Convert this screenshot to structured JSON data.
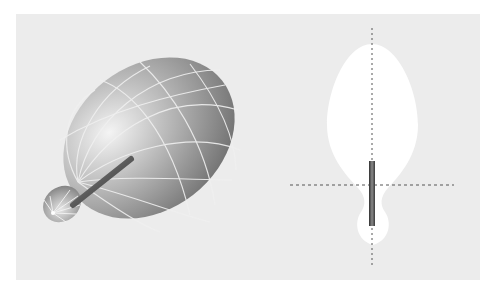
{
  "figure": {
    "background_color": "#ececec",
    "page_color": "#ffffff",
    "left_panel": {
      "type": "3d-radiation-pattern",
      "lobe_color": "#9a9a9a",
      "grid_line_color": "#f2f2f2",
      "antenna_color": "#555555"
    },
    "right_panel": {
      "type": "2d-radiation-pattern-cut",
      "lobe_fill": "#ffffff",
      "axis_style": "dashed",
      "axis_color": "#555555",
      "antenna_color": "#4a4a4a"
    }
  }
}
